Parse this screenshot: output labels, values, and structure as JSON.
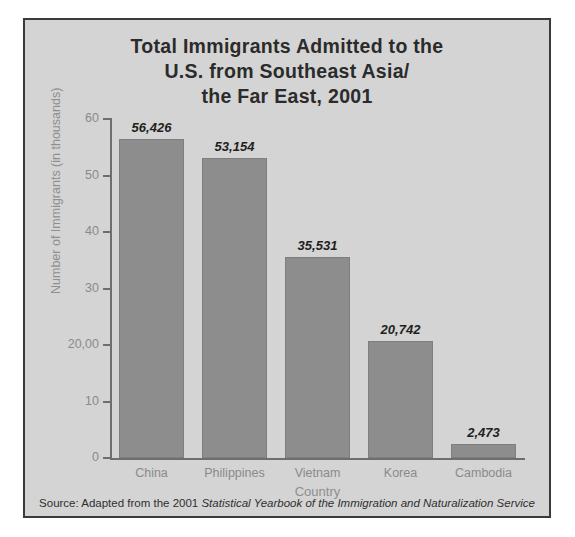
{
  "figure": {
    "title_lines": [
      "Total Immigrants Admitted to the",
      "U.S. from Southeast Asia/",
      "the Far East, 2001"
    ],
    "source_prefix": "Source: Adapted from the 2001 ",
    "source_italic": "Statistical Yearbook of the Immigration and Naturalization Service",
    "colors": {
      "background": "#d4d4d4",
      "frame_border": "#3a3a3a",
      "bar_fill": "#8d8d8d",
      "axis": "#6e6e6e",
      "tick_text": "#8a8a8a",
      "title_text": "#2b2b2b",
      "value_text": "#1f1f1f"
    }
  },
  "chart_data": {
    "type": "bar",
    "title": "Total Immigrants Admitted to the U.S. from Southeast Asia/ the Far East, 2001",
    "xlabel": "Country",
    "ylabel": "Number of Immigrants (in thousands)",
    "categories": [
      "China",
      "Philippines",
      "Vietnam",
      "Korea",
      "Cambodia"
    ],
    "values": [
      56.426,
      53.154,
      35.531,
      20.742,
      2.473
    ],
    "value_labels": [
      "56,426",
      "53,154",
      "35,531",
      "20,742",
      "2,473"
    ],
    "ylim": [
      0,
      60
    ],
    "yticks": [
      0,
      10,
      20,
      30,
      40,
      50,
      60
    ],
    "ytick_labels": [
      "0",
      "10",
      "20,00",
      "30",
      "40",
      "50",
      "60"
    ],
    "grid": false,
    "legend": false
  }
}
